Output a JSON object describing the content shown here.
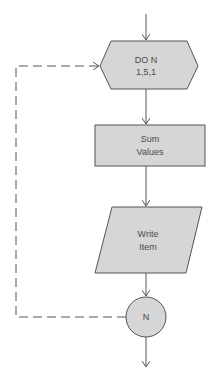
{
  "diagram": {
    "type": "flowchart",
    "colors": {
      "shape_fill": "#d6d6d6",
      "stroke": "#555555",
      "text": "#4a4a4a",
      "background": "#ffffff"
    },
    "nodes": [
      {
        "id": "do-loop",
        "shape": "hexagon",
        "lines": [
          "DO N",
          "1,5,1"
        ]
      },
      {
        "id": "sum",
        "shape": "rectangle",
        "lines": [
          "Sum",
          "Values"
        ]
      },
      {
        "id": "write",
        "shape": "parallelogram",
        "lines": [
          "Write",
          "Item"
        ]
      },
      {
        "id": "connector",
        "shape": "circle",
        "lines": [
          "N"
        ]
      }
    ],
    "edges": [
      {
        "from": "entry",
        "to": "do-loop",
        "style": "solid"
      },
      {
        "from": "do-loop",
        "to": "sum",
        "style": "solid"
      },
      {
        "from": "sum",
        "to": "write",
        "style": "solid"
      },
      {
        "from": "write",
        "to": "connector",
        "style": "solid"
      },
      {
        "from": "connector",
        "to": "do-loop",
        "style": "dashed",
        "label": "loop back"
      },
      {
        "from": "connector",
        "to": "exit",
        "style": "solid"
      }
    ]
  }
}
